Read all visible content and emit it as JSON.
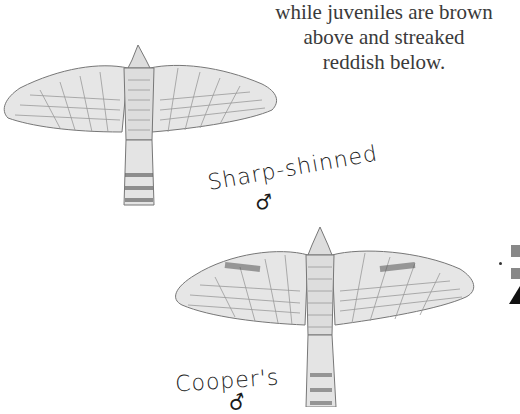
{
  "page": {
    "caption_cut_line": "gray above and streaked reddish below,",
    "caption_lines": [
      "while juveniles are brown",
      "above and streaked",
      "reddish below."
    ]
  },
  "illustrations": [
    {
      "name": "sharp-shinned-hawk",
      "label": "Sharp-shinned",
      "sex_symbol": "♂"
    },
    {
      "name": "coopers-hawk",
      "label": "Cooper's",
      "sex_symbol": "♂"
    }
  ],
  "edge_marks": {
    "square_color": "#888888",
    "triangle_color": "#111111"
  }
}
